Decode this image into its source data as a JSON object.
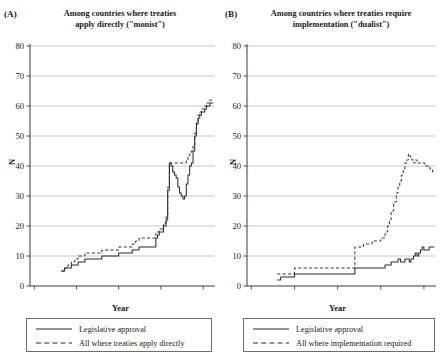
{
  "figure": {
    "panels": [
      {
        "letter": "(A)",
        "title": "Among countries where treaties apply directly (\"monist\")",
        "title_line1": "Among countries where treaties",
        "title_line2": "apply directly (\"monist\")",
        "ylabel": "N",
        "xlabel": "Year",
        "legend": [
          {
            "label": "Legislative approval",
            "style": "solid"
          },
          {
            "label": "All where treaties apply directly",
            "style": "dashed"
          }
        ]
      },
      {
        "letter": "(B)",
        "title": "Among countries where treaties require implementation (\"dualist\")",
        "title_line1": "Among countries where treaties require",
        "title_line2": "implementation (\"dualist\")",
        "ylabel": "N",
        "xlabel": "Year",
        "legend": [
          {
            "label": "Legislative approval",
            "style": "solid"
          },
          {
            "label": "All where implementation required",
            "style": "dashed"
          }
        ]
      }
    ],
    "colors": {
      "line": "#2b2b2b",
      "grid": "#b9b9b9",
      "axis": "#3c3c3c",
      "background": "#ffffff"
    }
  },
  "chart_data": [
    {
      "type": "line",
      "title": "Among countries where treaties apply directly (\"monist\")",
      "panel": "(A)",
      "xlabel": "Year",
      "ylabel": "N",
      "xlim": [
        1795,
        2014
      ],
      "ylim": [
        0,
        80
      ],
      "xticks": [
        1800,
        1850,
        1900,
        1950,
        2000
      ],
      "yticks": [
        0,
        10,
        20,
        30,
        40,
        50,
        60,
        70,
        80
      ],
      "grid": true,
      "legend_position": "below",
      "series": [
        {
          "name": "Legislative approval",
          "style": "solid",
          "x": [
            1832,
            1836,
            1840,
            1844,
            1848,
            1852,
            1856,
            1860,
            1864,
            1868,
            1872,
            1876,
            1880,
            1884,
            1888,
            1892,
            1896,
            1900,
            1904,
            1908,
            1912,
            1916,
            1920,
            1924,
            1928,
            1932,
            1936,
            1940,
            1944,
            1946,
            1948,
            1950,
            1953,
            1956,
            1958,
            1960,
            1962,
            1964,
            1966,
            1968,
            1970,
            1972,
            1974,
            1976,
            1978,
            1980,
            1982,
            1984,
            1986,
            1988,
            1990,
            1992,
            1994,
            1996,
            1998,
            2000,
            2002,
            2004,
            2006,
            2008,
            2010,
            2012
          ],
          "values": [
            5,
            6,
            6,
            7,
            7,
            8,
            8,
            9,
            9,
            9,
            9,
            9,
            10,
            10,
            10,
            10,
            10,
            11,
            11,
            11,
            11,
            12,
            12,
            13,
            13,
            13,
            13,
            13,
            16,
            17,
            18,
            18,
            20,
            22,
            32,
            41,
            40,
            38,
            37,
            36,
            33,
            31,
            30,
            29,
            30,
            34,
            37,
            40,
            41,
            45,
            50,
            54,
            56,
            57,
            58,
            58,
            59,
            60,
            60,
            61,
            61,
            61
          ]
        },
        {
          "name": "All where treaties apply directly",
          "style": "dashed",
          "x": [
            1832,
            1836,
            1840,
            1844,
            1848,
            1852,
            1856,
            1860,
            1864,
            1868,
            1872,
            1876,
            1880,
            1884,
            1888,
            1892,
            1896,
            1900,
            1904,
            1908,
            1912,
            1916,
            1920,
            1924,
            1928,
            1932,
            1936,
            1940,
            1944,
            1946,
            1948,
            1950,
            1953,
            1956,
            1958,
            1960,
            1962,
            1964,
            1966,
            1968,
            1970,
            1972,
            1974,
            1976,
            1978,
            1980,
            1982,
            1984,
            1986,
            1988,
            1990,
            1992,
            1994,
            1996,
            1998,
            2000,
            2002,
            2004,
            2006,
            2008,
            2010,
            2012
          ],
          "values": [
            5,
            6,
            7,
            8,
            9,
            10,
            10,
            11,
            11,
            11,
            11,
            11,
            12,
            12,
            12,
            12,
            12,
            13,
            13,
            13,
            13,
            14,
            15,
            16,
            16,
            16,
            16,
            16,
            18,
            18,
            19,
            19,
            21,
            23,
            33,
            41,
            41,
            41,
            41,
            41,
            41,
            41,
            41,
            41,
            41,
            42,
            43,
            44,
            45,
            47,
            51,
            55,
            57,
            58,
            59,
            59,
            60,
            61,
            61,
            62,
            62,
            62
          ]
        }
      ]
    },
    {
      "type": "line",
      "title": "Among countries where treaties require implementation (\"dualist\")",
      "panel": "(B)",
      "xlabel": "Year",
      "ylabel": "N",
      "xlim": [
        1795,
        2014
      ],
      "ylim": [
        0,
        80
      ],
      "xticks": [
        1800,
        1850,
        1900,
        1950,
        2000
      ],
      "yticks": [
        0,
        10,
        20,
        30,
        40,
        50,
        60,
        70,
        80
      ],
      "grid": true,
      "legend_position": "below",
      "series": [
        {
          "name": "Legislative approval",
          "style": "solid",
          "x": [
            1830,
            1834,
            1838,
            1842,
            1846,
            1850,
            1854,
            1860,
            1870,
            1880,
            1890,
            1900,
            1910,
            1918,
            1920,
            1924,
            1930,
            1936,
            1940,
            1945,
            1950,
            1955,
            1958,
            1962,
            1965,
            1968,
            1970,
            1973,
            1976,
            1978,
            1980,
            1983,
            1985,
            1988,
            1990,
            1992,
            1994,
            1996,
            1998,
            2000,
            2003,
            2006,
            2009,
            2012
          ],
          "values": [
            2,
            3,
            3,
            3,
            3,
            4,
            4,
            4,
            4,
            4,
            4,
            4,
            4,
            4,
            6,
            6,
            6,
            6,
            6,
            6,
            6,
            7,
            7,
            8,
            8,
            8,
            9,
            8,
            8,
            9,
            9,
            8,
            9,
            10,
            11,
            10,
            11,
            12,
            13,
            12,
            12,
            13,
            13,
            13
          ]
        },
        {
          "name": "All where implementation required",
          "style": "dashed",
          "x": [
            1830,
            1834,
            1838,
            1842,
            1846,
            1850,
            1854,
            1860,
            1870,
            1880,
            1890,
            1900,
            1910,
            1918,
            1920,
            1924,
            1930,
            1936,
            1940,
            1945,
            1950,
            1955,
            1958,
            1960,
            1962,
            1965,
            1968,
            1970,
            1972,
            1974,
            1976,
            1978,
            1980,
            1982,
            1984,
            1986,
            1988,
            1990,
            1992,
            1995,
            1998,
            2001,
            2004,
            2007,
            2010,
            2012
          ],
          "values": [
            4,
            4,
            4,
            4,
            4,
            6,
            6,
            6,
            6,
            6,
            6,
            6,
            6,
            6,
            13,
            13,
            14,
            14,
            15,
            15,
            16,
            18,
            20,
            22,
            25,
            28,
            31,
            33,
            35,
            37,
            39,
            41,
            42,
            44,
            43,
            42,
            41,
            42,
            41,
            41,
            41,
            40,
            40,
            39,
            38,
            38
          ]
        }
      ]
    }
  ]
}
